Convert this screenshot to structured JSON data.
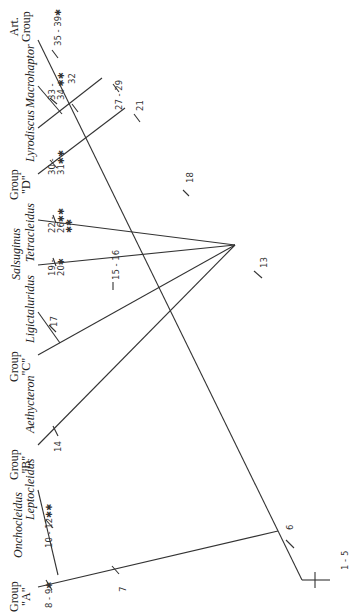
{
  "diagram": {
    "type": "cladogram",
    "orientation": "rotated-90-ccw",
    "line_color": "#333333"
  },
  "groups": {
    "a": {
      "line1": "Group",
      "line2": "\"A\""
    },
    "b": {
      "line1": "Group",
      "line2": "\"B\""
    },
    "c": {
      "line1": "Group",
      "line2": "\"C\""
    },
    "d": {
      "line1": "Group",
      "line2": "\"D\""
    },
    "art": {
      "line1": "Art.",
      "line2": "Group"
    }
  },
  "taxa": {
    "onchocleidus": "Onchocleidus",
    "leptocleidus": "Leptocleidus",
    "aethycteron": "Aethycteron",
    "ligictaluridus": "Ligictaluridus",
    "salsuginus": "Salsuginus",
    "tetracleidus": "Tetracleidus",
    "lyrodiscus": "Lyrodiscus",
    "macrohaptor": "Macrohaptor"
  },
  "characters": {
    "c1_5": "1 - 5",
    "c6": "6",
    "c7": "7",
    "c8_9": "8 - 9✱",
    "c10_12": "10 - 12✱✱",
    "c13": "13",
    "c14": "14",
    "c15_16": "15 - 16",
    "c17": "17",
    "c18": "18",
    "c19_20_a": "19 -",
    "c19_20_b": "20✱",
    "c21": "21",
    "c22_26_a": "22 -",
    "c22_26_b": "26✱✱",
    "c22_26_c": "✱✱",
    "c27_29": "27 - 29",
    "c30_31_a": "30 -",
    "c30_31_b": "31✱✱",
    "c32": "32",
    "c33_34_a": "33 -",
    "c33_34_b": "34 ✱✱",
    "c35_39": "35 - 39✱"
  }
}
